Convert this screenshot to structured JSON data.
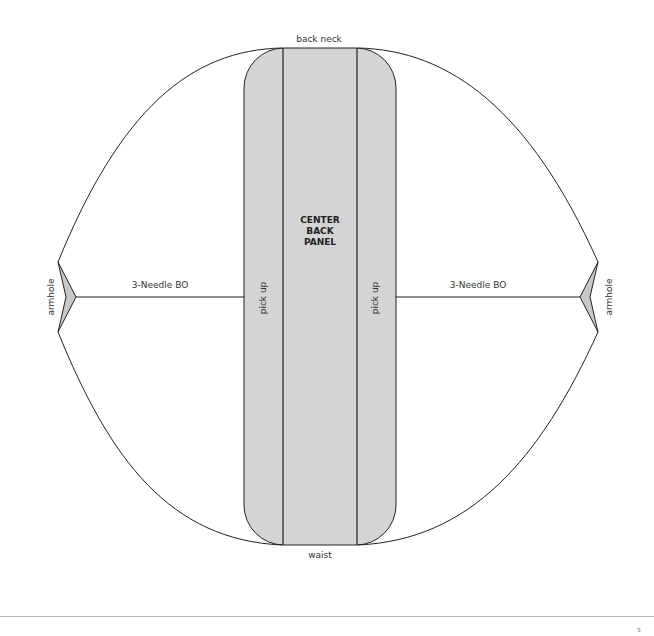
{
  "diagram": {
    "labels": {
      "top": "back neck",
      "bottom": "waist",
      "center_panel": [
        "CENTER",
        "BACK",
        "PANEL"
      ],
      "left_pickup": "pick up",
      "right_pickup": "pick up",
      "left_seam": "3-Needle BO",
      "right_seam": "3-Needle BO",
      "left_armhole": "armhole",
      "right_armhole": "armhole"
    },
    "colors": {
      "panel_fill": "#d4d4d4",
      "stroke": "#222222",
      "background": "#ffffff",
      "armhole_fill": "#c8c8c8",
      "rule": "#b8b8b8"
    }
  },
  "footer": {
    "page_mark": "5"
  }
}
